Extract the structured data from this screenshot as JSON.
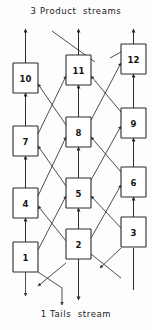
{
  "diagram": {
    "title_top": "3 Product  streams",
    "title_bottom": "1 Tails  stream",
    "type": "cascade-separation-flowsheet",
    "colors": {
      "background": "#fdfdfd",
      "line": "#3a3a3a",
      "box_stroke": "#2b2b2b",
      "box_fill": "#ffffff",
      "text": "#141414"
    },
    "geometry": {
      "width": 152,
      "height": 330,
      "box_width": 25,
      "box_height": 30,
      "columns_x": [
        13,
        66,
        121
      ],
      "column_centers": [
        25.5,
        78.5,
        133.5
      ]
    },
    "stages": [
      {
        "id": 1,
        "label": "1",
        "x": 13,
        "y": 242,
        "col": 0,
        "row": 0
      },
      {
        "id": 2,
        "label": "2",
        "x": 66,
        "y": 229,
        "col": 1,
        "row": 0
      },
      {
        "id": 3,
        "label": "3",
        "x": 121,
        "y": 217,
        "col": 2,
        "row": 0
      },
      {
        "id": 4,
        "label": "4",
        "x": 13,
        "y": 188,
        "col": 0,
        "row": 1
      },
      {
        "id": 5,
        "label": "5",
        "x": 66,
        "y": 178,
        "col": 1,
        "row": 1
      },
      {
        "id": 6,
        "label": "6",
        "x": 121,
        "y": 167,
        "col": 2,
        "row": 1
      },
      {
        "id": 7,
        "label": "7",
        "x": 13,
        "y": 126,
        "col": 0,
        "row": 2
      },
      {
        "id": 8,
        "label": "8",
        "x": 66,
        "y": 117,
        "col": 1,
        "row": 2
      },
      {
        "id": 9,
        "label": "9",
        "x": 121,
        "y": 108,
        "col": 2,
        "row": 2
      },
      {
        "id": 10,
        "label": "10",
        "x": 13,
        "y": 63,
        "col": 0,
        "row": 3
      },
      {
        "id": 11,
        "label": "11",
        "x": 66,
        "y": 55,
        "col": 1,
        "row": 3
      },
      {
        "id": 12,
        "label": "12",
        "x": 121,
        "y": 44,
        "col": 2,
        "row": 3
      }
    ],
    "product_streams": {
      "count": 3,
      "description": "3 Product  streams",
      "outlets": [
        {
          "from_stage": 10,
          "x": 25.5,
          "y_top": 28
        },
        {
          "from_stage": 11,
          "x": 78.5,
          "y_top": 28
        },
        {
          "from_stage": 12,
          "x": 133.5,
          "y_top": 28
        }
      ]
    },
    "tails_stream": {
      "count": 1,
      "description": "1 Tails  stream",
      "outlet": {
        "from_stage": 2,
        "x": 78.5,
        "y_bottom": 300
      }
    }
  }
}
